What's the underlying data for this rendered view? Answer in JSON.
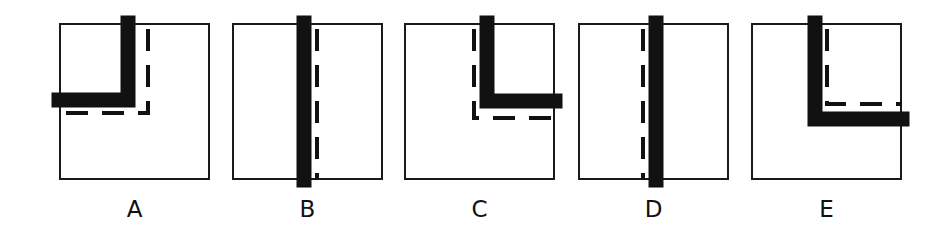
{
  "figure": {
    "colors": {
      "stroke": "#111111",
      "background": "#ffffff",
      "border": "#1a1a1a"
    },
    "panels": [
      {
        "label": "A",
        "left": 59,
        "solid": "M69 0 L69 77 L0 77",
        "dashed": "M89 0 L89 90 L0 90"
      },
      {
        "label": "B",
        "left": 232,
        "solid": "M72 0 L72 157",
        "dashed": "M85 0 L85 157"
      },
      {
        "label": "C",
        "left": 404,
        "solid": "M83 0 L83 78 L151 78",
        "dashed": "M70 0 L70 95 L151 95"
      },
      {
        "label": "D",
        "left": 578,
        "solid": "M78 0 L78 157",
        "dashed": "M65 0 L65 157"
      },
      {
        "label": "E",
        "left": 751,
        "solid": "M64 0 L64 96 L151 96",
        "dashed": "M76 0 L76 81 L151 81"
      }
    ]
  }
}
